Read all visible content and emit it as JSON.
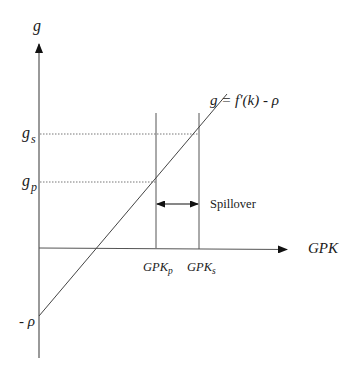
{
  "diagram": {
    "type": "economic-diagram",
    "y_axis": {
      "label": "g"
    },
    "x_axis": {
      "label": "GPK"
    },
    "curve": {
      "label_main": "g = f'(k) - ",
      "label_rho": "ρ"
    },
    "y_ticks": [
      {
        "base": "g",
        "sub": "s"
      },
      {
        "base": "g",
        "sub": "p"
      }
    ],
    "intercept": {
      "minus": "- ",
      "rho": "ρ"
    },
    "x_ticks": [
      {
        "base": "GPK",
        "sub": "p"
      },
      {
        "base": "GPK",
        "sub": "s"
      }
    ],
    "annotation": {
      "label": "Spillover"
    },
    "colors": {
      "line": "#444444",
      "dotted": "#777777",
      "text": "#1a1a1a",
      "background": "#ffffff"
    }
  }
}
